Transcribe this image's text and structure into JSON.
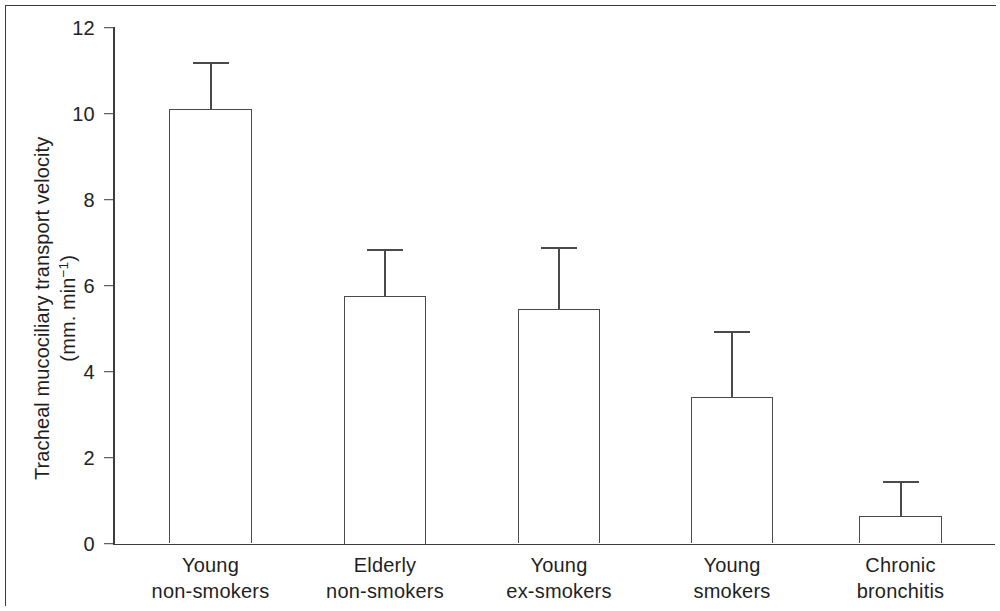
{
  "figure": {
    "frame_color": "#3a3a3a",
    "axis_color": "#3c3c3c",
    "bar_outline_color": "#4a4a4a",
    "background": "#ffffff"
  },
  "axis": {
    "y_title_line1": "Tracheal mucociliary transport velocity",
    "y_title_line2_prefix": "(mm. min",
    "y_title_line2_exponent": "−1",
    "y_title_line2_suffix": ")",
    "y_ticks": [
      "0",
      "2",
      "4",
      "6",
      "8",
      "10",
      "12"
    ]
  },
  "chart_data": {
    "type": "bar",
    "title": "",
    "subtitle": "",
    "xlabel": "",
    "ylabel": "Tracheal mucociliary transport velocity (mm. min⁻¹)",
    "ylim": [
      0,
      12
    ],
    "yticks": [
      0,
      2,
      4,
      6,
      8,
      10,
      12
    ],
    "grid": false,
    "legend": null,
    "error_bars": "upper-only (SD/SEM)",
    "categories": [
      "Young non-smokers",
      "Elderly non-smokers",
      "Young ex-smokers",
      "Young smokers",
      "Chronic bronchitis"
    ],
    "category_lines": [
      [
        "Young",
        "non-smokers"
      ],
      [
        "Elderly",
        "non-smokers"
      ],
      [
        "Young",
        "ex-smokers"
      ],
      [
        "Young",
        "smokers"
      ],
      [
        "Chronic",
        "bronchitis"
      ]
    ],
    "values": [
      10.1,
      5.75,
      5.45,
      3.4,
      0.65
    ],
    "error_upper": [
      11.2,
      6.85,
      6.9,
      4.95,
      1.45
    ],
    "error_delta": [
      1.1,
      1.1,
      1.45,
      1.55,
      0.8
    ],
    "series": [
      {
        "name": "Tracheal mucociliary transport velocity",
        "values": [
          10.1,
          5.75,
          5.45,
          3.4,
          0.65
        ]
      }
    ]
  },
  "geometry": {
    "plot_left": 113,
    "plot_baseline_y": 543.5,
    "plot_top_y": 27.5,
    "bars": [
      {
        "left": 169,
        "width": 83,
        "cap_width": 36
      },
      {
        "left": 344,
        "width": 82,
        "cap_width": 36
      },
      {
        "left": 518,
        "width": 82,
        "cap_width": 36
      },
      {
        "left": 691,
        "width": 82,
        "cap_width": 36
      },
      {
        "left": 859,
        "width": 83,
        "cap_width": 36
      }
    ]
  }
}
